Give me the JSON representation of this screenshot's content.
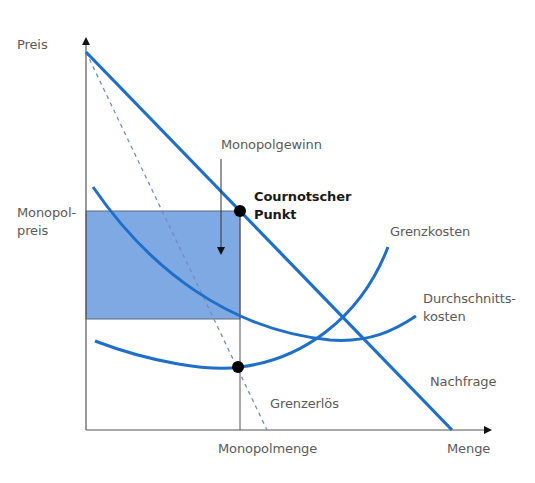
{
  "diagram": {
    "type": "monopoly-price-quantity",
    "colors": {
      "curve": "#1f6fc9",
      "profit_area": "#7ea9e3",
      "axis": "#555555",
      "point": "#000000"
    },
    "axes": {
      "y_label": "Preis",
      "x_label": "Menge"
    },
    "labels": {
      "monopoly_price_line1": "Monopol-",
      "monopoly_price_line2": "preis",
      "monopoly_quantity": "Monopolmenge",
      "monopoly_profit": "Monopolgewinn",
      "cournot_line1": "Cournotscher",
      "cournot_line2": "Punkt",
      "marginal_cost": "Grenzkosten",
      "average_cost_line1": "Durchschnitts-",
      "average_cost_line2": "kosten",
      "demand": "Nachfrage",
      "marginal_revenue": "Grenzerlös"
    },
    "curves": [
      {
        "name": "Nachfrage",
        "style": "solid"
      },
      {
        "name": "Grenzerlös",
        "style": "dashed"
      },
      {
        "name": "Grenzkosten",
        "style": "solid"
      },
      {
        "name": "Durchschnittskosten",
        "style": "solid"
      }
    ],
    "points": [
      {
        "name": "Cournotscher Punkt"
      },
      {
        "name": "Grenzkosten = Grenzerlös"
      }
    ]
  }
}
